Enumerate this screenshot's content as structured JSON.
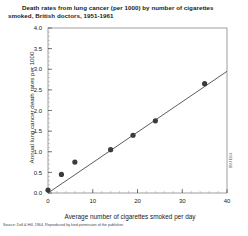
{
  "figure": {
    "title_line1": "Death rates from lung cancer (per 1000) by number of cigarettes",
    "title_line2": "smoked, British doctors, 1951-1961",
    "source_note": "Source: Doll & Hill, 1964. Reproduced by kind permission of the publisher.",
    "side_credit": "BMJ 1964"
  },
  "chart_data": {
    "type": "scatter",
    "title": "Death rates from lung cancer (per 1000) by number of cigarettes smoked, British doctors, 1951-1961",
    "xlabel": "Average number of cigarettes smoked per day",
    "ylabel": "Annual lung cancer death rates per 1000",
    "xlim": [
      0,
      40
    ],
    "ylim": [
      0,
      4.0
    ],
    "xticks": [
      0,
      10,
      20,
      30,
      40
    ],
    "xtick_labels": [
      "0",
      "10",
      "20",
      "30",
      "40"
    ],
    "yticks": [
      0.0,
      0.5,
      1.0,
      1.5,
      2.0,
      2.5,
      3.0,
      3.5,
      4.0
    ],
    "ytick_labels": [
      "0.0",
      "0.5",
      "1.0",
      "1.5",
      "2.0",
      "2.5",
      "3.0",
      "3.5",
      "4.0"
    ],
    "y_minor_tick_step": 0.1,
    "x_minor_tick_step": 2,
    "grid": false,
    "legend": "none",
    "marker": "filled-circle",
    "marker_color": "#3b3b3b",
    "line_color": "#4a4a4a",
    "frame_color": "#888888",
    "points": [
      {
        "x": 0,
        "y": 0.07
      },
      {
        "x": 3,
        "y": 0.45
      },
      {
        "x": 6,
        "y": 0.75
      },
      {
        "x": 14,
        "y": 1.05
      },
      {
        "x": 19,
        "y": 1.4
      },
      {
        "x": 24,
        "y": 1.75
      },
      {
        "x": 35,
        "y": 2.65
      }
    ],
    "fit_line": {
      "type": "linear-regression",
      "x_start": 0,
      "y_start": 0.0,
      "x_end": 40,
      "y_end": 2.95
    }
  }
}
